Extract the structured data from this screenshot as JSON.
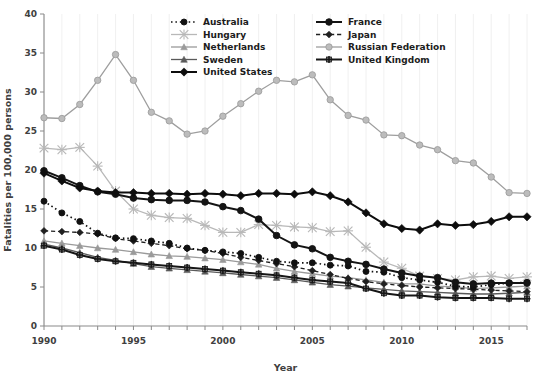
{
  "chart_data": {
    "type": "line",
    "title": "",
    "xlabel": "Year",
    "ylabel": "Fatalities per 100,000 persons",
    "xlim": [
      1990,
      2017
    ],
    "ylim": [
      0,
      40
    ],
    "xticks": [
      1990,
      1995,
      2000,
      2005,
      2010,
      2015
    ],
    "yticks": [
      0,
      5,
      10,
      15,
      20,
      25,
      30,
      35,
      40
    ],
    "grid": "vertical",
    "legend_position": "top-center",
    "x": [
      1990,
      1991,
      1992,
      1993,
      1994,
      1995,
      1996,
      1997,
      1998,
      1999,
      2000,
      2001,
      2002,
      2003,
      2004,
      2005,
      2006,
      2007,
      2008,
      2009,
      2010,
      2011,
      2012,
      2013,
      2014,
      2015,
      2016,
      2017
    ],
    "series": [
      {
        "name": "Australia",
        "color": "#111111",
        "style": "dotted",
        "marker": "circle",
        "values": [
          16.0,
          14.5,
          13.4,
          11.9,
          11.3,
          11.2,
          10.9,
          10.6,
          10.0,
          9.7,
          9.5,
          9.3,
          8.8,
          8.3,
          8.1,
          8.1,
          7.8,
          7.7,
          7.0,
          6.9,
          6.2,
          5.9,
          5.6,
          5.1,
          5.0,
          5.3,
          5.5,
          5.6
        ]
      },
      {
        "name": "Hungary",
        "color": "#b8b8b8",
        "style": "solid",
        "marker": "x",
        "values": [
          22.8,
          22.6,
          22.9,
          20.5,
          17.3,
          15.0,
          14.2,
          13.9,
          13.8,
          12.9,
          12.0,
          12.0,
          13.0,
          12.9,
          12.7,
          12.6,
          12.1,
          12.2,
          10.1,
          8.2,
          7.4,
          6.4,
          6.1,
          5.9,
          6.3,
          6.4,
          6.1,
          6.3
        ]
      },
      {
        "name": "Netherlands",
        "color": "#9a9a9a",
        "style": "solid",
        "marker": "triangle",
        "values": [
          10.9,
          10.6,
          10.3,
          10.0,
          9.8,
          9.5,
          9.2,
          9.0,
          8.9,
          8.7,
          8.5,
          8.2,
          7.9,
          7.4,
          7.0,
          6.7,
          6.4,
          6.2,
          5.9,
          5.6,
          5.4,
          5.4,
          5.1,
          5.0,
          4.8,
          4.9,
          5.0,
          5.1
        ]
      },
      {
        "name": "Sweden",
        "color": "#5a5a5a",
        "style": "solid",
        "marker": "triangle",
        "values": [
          10.5,
          10.0,
          9.4,
          8.8,
          8.4,
          8.0,
          7.6,
          7.4,
          7.2,
          7.0,
          6.8,
          6.6,
          6.4,
          6.2,
          5.9,
          5.6,
          5.3,
          5.1,
          4.9,
          4.7,
          4.5,
          4.4,
          4.3,
          4.2,
          4.1,
          4.1,
          4.2,
          4.3
        ]
      },
      {
        "name": "United States",
        "color": "#0d0d0d",
        "style": "solid",
        "marker": "diamond",
        "values": [
          19.6,
          18.6,
          17.7,
          17.3,
          17.1,
          17.1,
          17.0,
          17.0,
          16.9,
          17.0,
          16.9,
          16.7,
          17.0,
          17.0,
          16.9,
          17.2,
          16.7,
          15.9,
          14.5,
          13.1,
          12.5,
          12.3,
          13.1,
          12.9,
          13.0,
          13.4,
          14.0,
          14.0
        ]
      },
      {
        "name": "France",
        "color": "#141414",
        "style": "solid",
        "marker": "circle",
        "values": [
          19.9,
          19.0,
          18.0,
          17.2,
          16.9,
          16.4,
          16.2,
          16.1,
          16.1,
          15.9,
          15.3,
          14.8,
          13.7,
          11.6,
          10.4,
          9.9,
          8.8,
          8.3,
          7.9,
          7.3,
          6.8,
          6.4,
          6.2,
          5.6,
          5.4,
          5.5,
          5.5,
          5.5
        ]
      },
      {
        "name": "Japan",
        "color": "#202020",
        "style": "dashed",
        "marker": "diamond",
        "values": [
          12.2,
          12.1,
          12.0,
          11.8,
          11.2,
          10.9,
          10.6,
          10.3,
          9.9,
          9.7,
          9.3,
          8.8,
          8.4,
          8.0,
          7.6,
          7.1,
          6.6,
          6.1,
          5.7,
          5.4,
          5.2,
          5.0,
          4.9,
          4.8,
          4.7,
          4.6,
          4.5,
          4.4
        ]
      },
      {
        "name": "Russian Federation",
        "color": "#9e9e9e",
        "style": "solid",
        "marker": "circle",
        "values": [
          26.7,
          26.6,
          28.4,
          31.5,
          34.8,
          31.5,
          27.4,
          26.3,
          24.6,
          25.0,
          26.9,
          28.5,
          30.1,
          31.5,
          31.3,
          32.2,
          29.0,
          27.0,
          26.4,
          24.5,
          24.4,
          23.2,
          22.6,
          21.2,
          20.9,
          19.1,
          17.1,
          17.0
        ]
      },
      {
        "name": "United Kingdom",
        "color": "#161616",
        "style": "solid",
        "marker": "plus",
        "values": [
          10.3,
          9.8,
          9.1,
          8.6,
          8.3,
          8.1,
          7.9,
          7.7,
          7.5,
          7.3,
          7.1,
          6.9,
          6.7,
          6.5,
          6.2,
          5.9,
          5.7,
          5.5,
          4.8,
          4.2,
          3.9,
          3.9,
          3.7,
          3.6,
          3.6,
          3.6,
          3.5,
          3.5
        ]
      }
    ],
    "legend_entries": [
      {
        "name": "Australia"
      },
      {
        "name": "France"
      },
      {
        "name": "Hungary"
      },
      {
        "name": "Japan"
      },
      {
        "name": "Netherlands"
      },
      {
        "name": "Russian Federation"
      },
      {
        "name": "Sweden"
      },
      {
        "name": "United Kingdom"
      },
      {
        "name": "United States"
      }
    ]
  }
}
